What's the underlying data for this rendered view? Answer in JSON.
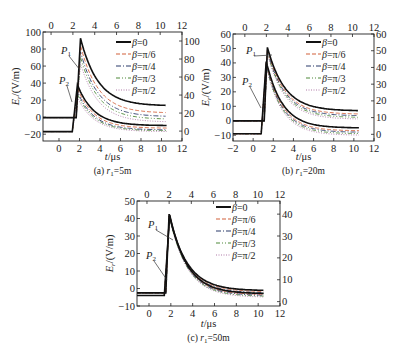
{
  "chart_data": [
    {
      "type": "line",
      "caption": "(a) r1=5m",
      "caption_parts": {
        "prefix": "(a) ",
        "var": "r",
        "sub": "1",
        "suffix": "=5m"
      },
      "xlabel": "t/μs",
      "ylabel": "Er/(V/m)",
      "x_bottom": {
        "ticks": [
          0,
          2,
          4,
          6,
          8,
          10,
          12
        ],
        "range": [
          -1.56,
          12
        ]
      },
      "x_top": {
        "ticks": [
          0,
          2,
          4,
          6,
          8,
          10,
          12
        ],
        "range": [
          -0.74,
          12
        ]
      },
      "y_left": {
        "ticks": [
          -20,
          0,
          20,
          40,
          60,
          80,
          100
        ],
        "range": [
          -28,
          100
        ]
      },
      "y_right": {
        "ticks": [
          0,
          20,
          40,
          60,
          80,
          100
        ],
        "range": [
          -11,
          110
        ]
      },
      "annotations": [
        "P1",
        "P2"
      ],
      "legend": [
        "β=0",
        "β=π/6",
        "β=π/4",
        "β=π/3",
        "β=π/2"
      ],
      "series_P1_right_axis": [
        {
          "name": "β=0",
          "baseline": 15,
          "rise_t": 2.3,
          "peak_t": 2.7,
          "peak": 103,
          "tail": 28
        },
        {
          "name": "β=π/6",
          "baseline": 15,
          "rise_t": 2.3,
          "peak_t": 2.7,
          "peak": 95,
          "tail": 20
        },
        {
          "name": "β=π/4",
          "baseline": 15,
          "rise_t": 2.3,
          "peak_t": 2.7,
          "peak": 88,
          "tail": 16
        },
        {
          "name": "β=π/3",
          "baseline": 15,
          "rise_t": 2.3,
          "peak_t": 2.7,
          "peak": 82,
          "tail": 13
        },
        {
          "name": "β=π/2",
          "baseline": 15,
          "rise_t": 2.3,
          "peak_t": 2.7,
          "peak": 75,
          "tail": 10
        }
      ],
      "series_P2_left_axis": [
        {
          "name": "β=0",
          "baseline": -17,
          "rise_t": 1.3,
          "peak_t": 1.8,
          "peak": 38,
          "tail": -10
        },
        {
          "name": "β=π/6",
          "baseline": -17,
          "rise_t": 1.3,
          "peak_t": 1.8,
          "peak": 34,
          "tail": -13
        },
        {
          "name": "β=π/4",
          "baseline": -17,
          "rise_t": 1.3,
          "peak_t": 1.8,
          "peak": 30,
          "tail": -15
        },
        {
          "name": "β=π/3",
          "baseline": -17,
          "rise_t": 1.3,
          "peak_t": 1.8,
          "peak": 27,
          "tail": -16
        },
        {
          "name": "β=π/2",
          "baseline": -17,
          "rise_t": 1.3,
          "peak_t": 1.8,
          "peak": 23,
          "tail": -17
        }
      ]
    },
    {
      "type": "line",
      "caption": "(b) r1=20m",
      "caption_parts": {
        "prefix": "(b) ",
        "var": "r",
        "sub": "1",
        "suffix": "=20m"
      },
      "xlabel": "t/μs",
      "ylabel": "Er/(V/m)",
      "x_bottom": {
        "ticks": [
          -2,
          0,
          2,
          4,
          6,
          8,
          10,
          12
        ],
        "range": [
          -2,
          12
        ]
      },
      "x_top": {
        "ticks": [
          0,
          2,
          4,
          6,
          8,
          10,
          12
        ],
        "range": [
          -1.1,
          12
        ]
      },
      "y_left": {
        "ticks": [
          -10,
          0,
          10,
          20,
          30,
          40,
          50,
          60
        ],
        "range": [
          -14,
          60
        ]
      },
      "y_right": {
        "ticks": [
          0,
          10,
          20,
          30,
          40,
          50,
          60
        ],
        "range": [
          -4,
          60
        ]
      },
      "annotations": [
        "P1",
        "P2"
      ],
      "legend": [
        "β=0",
        "β=π/6",
        "β=π/4",
        "β=π/3",
        "β=π/2"
      ],
      "series_P1_right_axis": [
        {
          "name": "β=0",
          "baseline": 8,
          "rise_t": 1.8,
          "peak_t": 2.1,
          "peak": 52,
          "tail": 14
        },
        {
          "name": "β=π/6",
          "baseline": 8,
          "rise_t": 1.8,
          "peak_t": 2.1,
          "peak": 51,
          "tail": 12
        },
        {
          "name": "β=π/4",
          "baseline": 8,
          "rise_t": 1.8,
          "peak_t": 2.1,
          "peak": 50,
          "tail": 11
        },
        {
          "name": "β=π/3",
          "baseline": 8,
          "rise_t": 1.8,
          "peak_t": 2.1,
          "peak": 49,
          "tail": 10
        },
        {
          "name": "β=π/2",
          "baseline": 8,
          "rise_t": 1.8,
          "peak_t": 2.1,
          "peak": 48,
          "tail": 9
        }
      ],
      "series_P2_left_axis": [
        {
          "name": "β=0",
          "baseline": -9,
          "rise_t": 0.8,
          "peak_t": 1.3,
          "peak": 41,
          "tail": -5
        },
        {
          "name": "β=π/6",
          "baseline": -9,
          "rise_t": 0.8,
          "peak_t": 1.3,
          "peak": 40,
          "tail": -7
        },
        {
          "name": "β=π/4",
          "baseline": -9,
          "rise_t": 0.8,
          "peak_t": 1.3,
          "peak": 39,
          "tail": -8
        },
        {
          "name": "β=π/3",
          "baseline": -9,
          "rise_t": 0.8,
          "peak_t": 1.3,
          "peak": 38,
          "tail": -9
        },
        {
          "name": "β=π/2",
          "baseline": -9,
          "rise_t": 0.8,
          "peak_t": 1.3,
          "peak": 37,
          "tail": -10
        }
      ]
    },
    {
      "type": "line",
      "caption": "(c) r1=50m",
      "caption_parts": {
        "prefix": "(c) ",
        "var": "r",
        "sub": "1",
        "suffix": "=50m"
      },
      "xlabel": "t/μs",
      "ylabel": "Er/(V/m)",
      "x_bottom": {
        "ticks": [
          0,
          2,
          4,
          6,
          8,
          10,
          12
        ],
        "range": [
          -1.1,
          12
        ]
      },
      "x_top": {
        "ticks": [
          0,
          2,
          4,
          6,
          8,
          10,
          12
        ],
        "range": [
          -0.9,
          12
        ]
      },
      "y_left": {
        "ticks": [
          -10,
          0,
          10,
          20,
          30,
          40,
          50
        ],
        "range": [
          -10,
          50
        ]
      },
      "y_right": {
        "ticks": [
          0,
          10,
          20,
          30,
          40
        ],
        "range": [
          -2,
          46
        ]
      },
      "annotations": [
        "P1",
        "P2"
      ],
      "legend": [
        "β=0",
        "β=π/6",
        "β=π/4",
        "β=π/3",
        "β=π/2"
      ],
      "series_P1_right_axis": [
        {
          "name": "β=0",
          "baseline": 4,
          "rise_t": 1.7,
          "peak_t": 2.0,
          "peak": 40,
          "tail": 5
        },
        {
          "name": "β=π/6",
          "baseline": 4,
          "rise_t": 1.7,
          "peak_t": 2.0,
          "peak": 40,
          "tail": 4.5
        },
        {
          "name": "β=π/4",
          "baseline": 4,
          "rise_t": 1.7,
          "peak_t": 2.0,
          "peak": 39.5,
          "tail": 4
        },
        {
          "name": "β=π/3",
          "baseline": 4,
          "rise_t": 1.7,
          "peak_t": 2.0,
          "peak": 39,
          "tail": 3.5
        },
        {
          "name": "β=π/2",
          "baseline": 4,
          "rise_t": 1.7,
          "peak_t": 2.0,
          "peak": 39,
          "tail": 3
        }
      ],
      "series_P2_left_axis": [
        {
          "name": "β=0",
          "baseline": -4,
          "rise_t": 1.4,
          "peak_t": 1.9,
          "peak": 42,
          "tail": -3
        },
        {
          "name": "β=π/6",
          "baseline": -4,
          "rise_t": 1.4,
          "peak_t": 1.9,
          "peak": 42,
          "tail": -3.5
        },
        {
          "name": "β=π/4",
          "baseline": -4,
          "rise_t": 1.4,
          "peak_t": 1.9,
          "peak": 41.5,
          "tail": -4
        },
        {
          "name": "β=π/3",
          "baseline": -4,
          "rise_t": 1.4,
          "peak_t": 1.9,
          "peak": 41,
          "tail": -4.5
        },
        {
          "name": "β=π/2",
          "baseline": -4,
          "rise_t": 1.4,
          "peak_t": 1.9,
          "peak": 41,
          "tail": -5
        }
      ]
    }
  ],
  "styles": {
    "series_colors": [
      "#111111",
      "#d2603a",
      "#2b3a6b",
      "#4f8a3a",
      "#b07aa8"
    ],
    "series_dash": [
      "",
      "4,2",
      "5,2,1,2",
      "4,2,1,2,1,2",
      "1,1.5"
    ],
    "series_width": [
      1.6,
      0.9,
      0.9,
      0.9,
      0.9
    ],
    "axis_color": "#222222"
  }
}
